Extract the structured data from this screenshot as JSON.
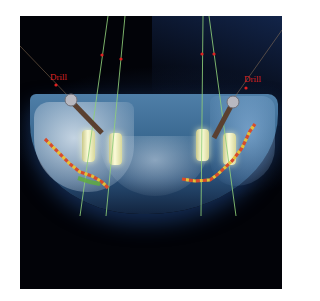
{
  "image": {
    "description": "3D CBCT rendering of mandible with four dental implants, drill guides and nerve canal path",
    "labels": {
      "left_drill": "Drill",
      "right_drill": "Drill"
    },
    "colors": {
      "background": "#020308",
      "bone": "#4f7fa8",
      "guide_lines": "#8fcf7a",
      "label": "#dd2222",
      "nerve_path_primary": "#e8c033",
      "nerve_path_secondary": "#d84b2a"
    },
    "implant_count": 4,
    "drill_count": 2
  }
}
